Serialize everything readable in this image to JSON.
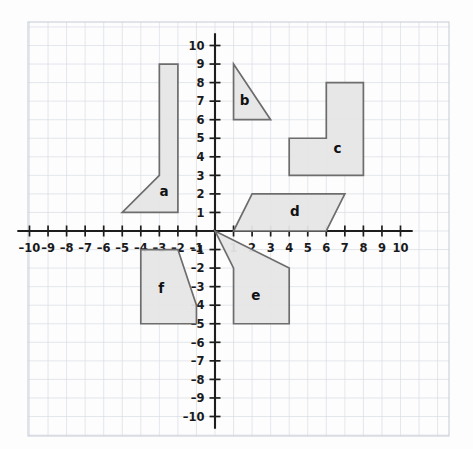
{
  "figure": {
    "type": "coordinate-plane",
    "background_color": "#fdfdfd",
    "grid_color": "#d8dde4",
    "axis_color": "#1d1d1d",
    "shape_fill": "#e6e6e6",
    "shape_stroke": "#6d6d6d"
  },
  "axes": {
    "x": {
      "label": "",
      "min": -10,
      "max": 10,
      "tick_labels": [
        "-10",
        "-9",
        "-8",
        "-7",
        "-6",
        "-5",
        "-4",
        "-3",
        "-2",
        "-1",
        "1",
        "2",
        "3",
        "4",
        "5",
        "6",
        "7",
        "8",
        "9",
        "10"
      ],
      "tick_values": [
        -10,
        -9,
        -8,
        -7,
        -6,
        -5,
        -4,
        -3,
        -2,
        -1,
        1,
        2,
        3,
        4,
        5,
        6,
        7,
        8,
        9,
        10
      ]
    },
    "y": {
      "label": "",
      "min": -10,
      "max": 10,
      "tick_labels": [
        "10",
        "9",
        "8",
        "7",
        "6",
        "5",
        "4",
        "3",
        "2",
        "1",
        "-1",
        "-2",
        "-3",
        "-4",
        "-5",
        "-6",
        "-7",
        "-8",
        "-9",
        "-10"
      ],
      "tick_values": [
        10,
        9,
        8,
        7,
        6,
        5,
        4,
        3,
        2,
        1,
        -1,
        -2,
        -3,
        -4,
        -5,
        -6,
        -7,
        -8,
        -9,
        -10
      ]
    },
    "origin_label": ""
  },
  "chart_data": {
    "type": "scatter",
    "title": "",
    "xlabel": "",
    "ylabel": "",
    "xlim": [
      -10,
      10
    ],
    "ylim": [
      -10,
      10
    ],
    "grid": true,
    "legend": "none",
    "shapes": [
      {
        "label": "a",
        "kind": "polygon",
        "vertices": [
          [
            -3,
            9
          ],
          [
            -2,
            9
          ],
          [
            -2,
            1
          ],
          [
            -5,
            1
          ],
          [
            -3,
            3
          ]
        ],
        "label_position": [
          -2.75,
          2.1
        ]
      },
      {
        "label": "b",
        "kind": "triangle",
        "vertices": [
          [
            1,
            9
          ],
          [
            3,
            6
          ],
          [
            1,
            6
          ]
        ],
        "label_position": [
          1.6,
          7.0
        ]
      },
      {
        "label": "c",
        "kind": "polygon",
        "vertices": [
          [
            6,
            8
          ],
          [
            8,
            8
          ],
          [
            8,
            3
          ],
          [
            4,
            3
          ],
          [
            4,
            5
          ],
          [
            6,
            5
          ]
        ],
        "label_position": [
          6.6,
          4.4
        ]
      },
      {
        "label": "d",
        "kind": "parallelogram",
        "vertices": [
          [
            2,
            2
          ],
          [
            7,
            2
          ],
          [
            6,
            0
          ],
          [
            1,
            0
          ]
        ],
        "label_position": [
          4.3,
          1.0
        ]
      },
      {
        "label": "e",
        "kind": "polygon",
        "vertices": [
          [
            0,
            0
          ],
          [
            4,
            -2
          ],
          [
            4,
            -5
          ],
          [
            1,
            -5
          ],
          [
            1,
            -2
          ]
        ],
        "label_position": [
          2.2,
          -3.5
        ]
      },
      {
        "label": "f",
        "kind": "polygon",
        "vertices": [
          [
            -4,
            -1
          ],
          [
            -2,
            -1
          ],
          [
            -1,
            -4
          ],
          [
            -1,
            -5
          ],
          [
            -4,
            -5
          ]
        ],
        "label_position": [
          -2.9,
          -3.1
        ]
      }
    ]
  }
}
